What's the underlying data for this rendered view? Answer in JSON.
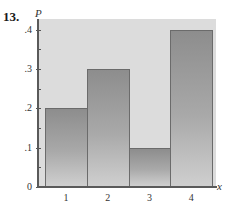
{
  "problem_number": "13.",
  "chart_data": {
    "type": "bar",
    "title": "",
    "xlabel": "x",
    "ylabel": "P",
    "categories": [
      "1",
      "2",
      "3",
      "4"
    ],
    "values": [
      0.2,
      0.3,
      0.1,
      0.4
    ],
    "ylim": [
      0,
      0.42
    ],
    "yticks": [
      0,
      0.1,
      0.2,
      0.3,
      0.4
    ],
    "ytick_labels": [
      "0",
      ".1",
      ".2",
      ".3",
      ".4"
    ],
    "minor_yticks": [
      0.05,
      0.15,
      0.25,
      0.35
    ],
    "grid": false,
    "legend": null,
    "bar_style": "adjacent bars (histogram), gray gradient fill",
    "colors": {
      "plot_background": "#dcdcdc",
      "bar_top": "#8d8d8d",
      "bar_bottom": "#cfcfcf",
      "axis": "#5a5a5a"
    }
  },
  "labels": {
    "x_axis": "x",
    "y_axis": "P",
    "y_ticks": [
      "0",
      ".1",
      ".2",
      ".3",
      ".4"
    ],
    "x_ticks": [
      "1",
      "2",
      "3",
      "4"
    ]
  }
}
